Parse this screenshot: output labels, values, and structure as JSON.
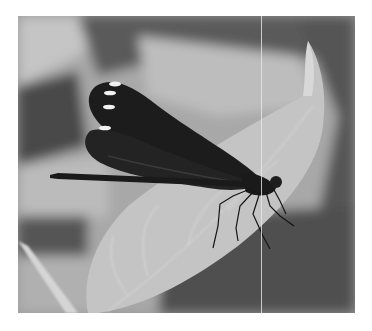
{
  "image": {
    "description": "Grayscale photograph of a dark-winged damselfly with white wing-tip spots perched on a pale leaf",
    "subject": "damselfly",
    "background": "blurred leaves",
    "colors": {
      "page": "#ffffff",
      "wing": "#1a1a1a",
      "wing_spot": "#f2f2f2",
      "leaf": "#c8c8c8",
      "shadow": "#4a4a4a",
      "light_bg": "#b5b5b5"
    },
    "wing_spots": 4
  }
}
